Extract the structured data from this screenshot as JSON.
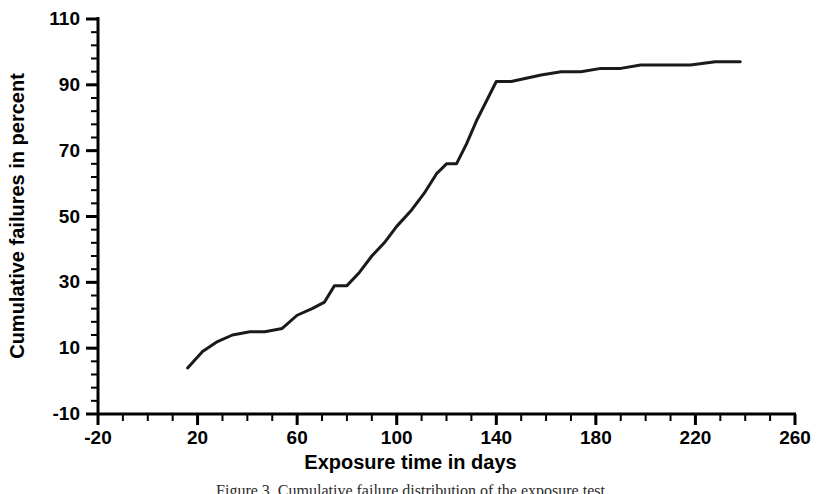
{
  "figure": {
    "background_color": "#ffffff",
    "line_color": "#1a1a1a",
    "axis_color": "#000000",
    "caption": "Figure 3. Cumulative failure distribution of the exposure test"
  },
  "axis_titles": {
    "x": "Exposure time in days",
    "y": "Cumulative failures in percent"
  },
  "chart_data": {
    "type": "line",
    "title": "",
    "xlabel": "Exposure time in days",
    "ylabel": "Cumulative failures in percent",
    "xlim": [
      -20,
      260
    ],
    "ylim": [
      -10,
      110
    ],
    "xticks": [
      -20,
      20,
      60,
      100,
      140,
      180,
      220,
      260
    ],
    "xtick_labels": [
      "-20",
      "20",
      "60",
      "100",
      "140",
      "180",
      "220",
      "260"
    ],
    "yticks": [
      -10,
      10,
      30,
      50,
      70,
      90,
      110
    ],
    "ytick_labels": [
      "-10",
      "10",
      "30",
      "50",
      "70",
      "90",
      "110"
    ],
    "x_minor_tick_step": 10,
    "y_minor_tick_step": 4,
    "grid": false,
    "legend": null,
    "series": [
      {
        "name": "Cumulative failures",
        "x": [
          16,
          22,
          28,
          34,
          41,
          47,
          54,
          60,
          66,
          71,
          75,
          80,
          85,
          90,
          95,
          100,
          106,
          111,
          116,
          120,
          124,
          128,
          132,
          136,
          140,
          146,
          152,
          158,
          166,
          174,
          182,
          190,
          198,
          208,
          218,
          228,
          238
        ],
        "y": [
          4,
          9,
          12,
          14,
          15,
          15,
          16,
          20,
          22,
          24,
          29,
          29,
          33,
          38,
          42,
          47,
          52,
          57,
          63,
          66,
          66,
          72,
          79,
          85,
          91,
          91,
          92,
          93,
          94,
          94,
          95,
          95,
          96,
          96,
          96,
          97,
          97
        ]
      }
    ]
  }
}
